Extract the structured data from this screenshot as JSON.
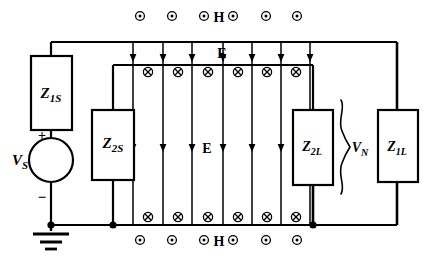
{
  "figure": {
    "background_color": "#ffffff",
    "line_color": "#000000"
  },
  "labels": {
    "z1s": "Z",
    "z1s_sub": "1S",
    "z2s": "Z",
    "z2s_sub": "2S",
    "z2l": "Z",
    "z2l_sub": "2L",
    "z1l": "Z",
    "z1l_sub": "1L",
    "vs": "V",
    "vs_sub": "S",
    "vn": "V",
    "vn_sub": "N",
    "plus": "+",
    "minus": "−",
    "h_top": "H",
    "h_bottom": "H",
    "e_top": "E",
    "e_middle": "E"
  },
  "components": {
    "z1s": {
      "name": "Z1S",
      "x": 31,
      "y": 56,
      "w": 41,
      "h": 74
    },
    "z2s": {
      "name": "Z2S",
      "x": 92,
      "y": 110,
      "w": 42,
      "h": 70
    },
    "z2l": {
      "name": "Z2L",
      "x": 293,
      "y": 110,
      "w": 40,
      "h": 75
    },
    "z1l": {
      "name": "Z1L",
      "x": 378,
      "y": 110,
      "w": 40,
      "h": 72
    },
    "source": {
      "name": "VS",
      "cx": 51,
      "cy": 160,
      "r": 22
    },
    "ground": {
      "name": "ground",
      "x": 51,
      "y": 227
    }
  },
  "field_symbols": {
    "h_out_of_page_top": {
      "glyph": "circle-dot",
      "meaning": "H field out of page",
      "y": 16,
      "x_positions": [
        140,
        172,
        204,
        233,
        266,
        297
      ]
    },
    "h_out_of_page_bottom": {
      "glyph": "circle-dot",
      "meaning": "H field out of page",
      "y": 240,
      "x_positions": [
        140,
        172,
        204,
        233,
        266,
        297
      ]
    },
    "e_into_page_upper": {
      "glyph": "circle-x",
      "meaning": "into page",
      "y": 72,
      "x_positions": [
        148,
        178,
        208,
        238,
        267,
        296
      ]
    },
    "e_into_page_lower": {
      "glyph": "circle-x",
      "meaning": "into page",
      "y": 217,
      "x_positions": [
        148,
        178,
        208,
        238,
        267,
        296
      ]
    }
  },
  "field_lines": {
    "vertical_x": [
      133,
      163,
      192,
      223,
      252,
      281,
      310
    ],
    "top_y": 42,
    "bottom_y": 225,
    "arrow_rows_y": [
      58,
      148
    ]
  },
  "wires": {
    "top_rail_y": 42,
    "bottom_rail_y": 225,
    "inner_top_y": 65,
    "inner_bottom_y": 225,
    "left_x": 51,
    "right_x": 397,
    "inner_left_x": 113,
    "inner_right_x": 313
  },
  "nodes": [
    {
      "name": "ground-node",
      "x": 51,
      "y": 225
    },
    {
      "name": "z2s-bottom-node",
      "x": 113,
      "y": 225
    },
    {
      "name": "z2l-bottom-node",
      "x": 313,
      "y": 225
    }
  ],
  "brace": {
    "name": "vn-brace",
    "x": 340,
    "top_y": 100,
    "bottom_y": 192,
    "label_x": 352,
    "label_y": 152
  }
}
